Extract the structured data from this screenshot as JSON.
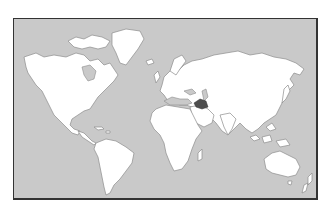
{
  "map": {
    "type": "world-outline-map",
    "projection": "miller-like",
    "colors": {
      "ocean": "#c9c9c9",
      "land": "#ffffff",
      "coastline": "#8c8c8c",
      "highlight": "#4d4d4d",
      "frame": "#333333"
    },
    "highlighted_regions": [
      {
        "name": "Iraq",
        "color": "#4d4d4d"
      }
    ]
  }
}
